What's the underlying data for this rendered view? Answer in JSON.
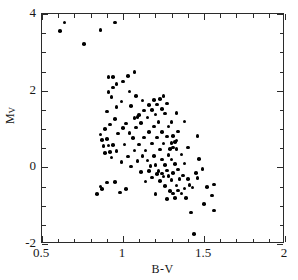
{
  "chart_data": {
    "type": "scatter",
    "title": "",
    "xlabel": "B-V",
    "ylabel": "M_V",
    "ylabel_base": "M",
    "ylabel_sub": "V",
    "xlim": [
      0.5,
      2.0
    ],
    "ylim": [
      4.0,
      -2.0
    ],
    "y_inverted": true,
    "grid": false,
    "legend": null,
    "xticks_major": [
      0.5,
      1.0,
      1.5,
      2.0
    ],
    "xticklabels": [
      "0.5",
      "1",
      "1.5",
      "2"
    ],
    "xticks_minor": [
      0.6,
      0.7,
      0.8,
      0.9,
      1.1,
      1.2,
      1.3,
      1.4,
      1.6,
      1.7,
      1.8,
      1.9
    ],
    "yticks_major": [
      -2,
      0,
      2,
      4
    ],
    "yticklabels": [
      "-2",
      "0",
      "2",
      "4"
    ],
    "yticks_minor": [
      -1.5,
      -1.0,
      -0.5,
      0.5,
      1.0,
      1.5,
      2.5,
      3.0,
      3.5
    ],
    "marker": "filled-circle",
    "marker_color": "#000000",
    "marker_size_px": 3.6,
    "n_points": 148,
    "points": [
      [
        1.44,
        -1.74
      ],
      [
        1.42,
        -1.18
      ],
      [
        1.56,
        -1.13
      ],
      [
        1.5,
        -0.95
      ],
      [
        1.27,
        -0.83
      ],
      [
        1.32,
        -0.8
      ],
      [
        1.39,
        -0.8
      ],
      [
        1.55,
        -0.74
      ],
      [
        0.84,
        -0.7
      ],
      [
        1.2,
        -0.7
      ],
      [
        1.31,
        -0.68
      ],
      [
        1.36,
        -0.68
      ],
      [
        0.98,
        -0.66
      ],
      [
        1.29,
        -0.62
      ],
      [
        1.34,
        -0.6
      ],
      [
        0.87,
        -0.57
      ],
      [
        1.02,
        -0.56
      ],
      [
        1.38,
        -0.55
      ],
      [
        1.43,
        -0.53
      ],
      [
        1.52,
        -0.52
      ],
      [
        0.86,
        -0.5
      ],
      [
        1.26,
        -0.49
      ],
      [
        1.33,
        -0.47
      ],
      [
        1.41,
        -0.46
      ],
      [
        1.56,
        -0.45
      ],
      [
        0.9,
        -0.4
      ],
      [
        0.95,
        -0.38
      ],
      [
        1.14,
        -0.37
      ],
      [
        1.23,
        -0.35
      ],
      [
        1.3,
        -0.33
      ],
      [
        1.35,
        -0.31
      ],
      [
        1.4,
        -0.3
      ],
      [
        1.46,
        -0.28
      ],
      [
        1.18,
        -0.26
      ],
      [
        1.25,
        -0.24
      ],
      [
        1.28,
        -0.22
      ],
      [
        1.37,
        -0.21
      ],
      [
        1.21,
        -0.18
      ],
      [
        1.24,
        -0.16
      ],
      [
        1.31,
        -0.15
      ],
      [
        1.45,
        -0.15
      ],
      [
        1.11,
        -0.12
      ],
      [
        1.16,
        -0.1
      ],
      [
        1.22,
        -0.09
      ],
      [
        1.27,
        -0.08
      ],
      [
        1.34,
        -0.06
      ],
      [
        1.49,
        -0.04
      ],
      [
        1.05,
        0.02
      ],
      [
        1.17,
        0.04
      ],
      [
        1.2,
        0.06
      ],
      [
        1.26,
        0.06
      ],
      [
        1.32,
        0.08
      ],
      [
        1.38,
        0.1
      ],
      [
        0.99,
        0.14
      ],
      [
        1.09,
        0.16
      ],
      [
        1.15,
        0.18
      ],
      [
        1.24,
        0.2
      ],
      [
        1.3,
        0.2
      ],
      [
        1.47,
        0.22
      ],
      [
        0.93,
        0.26
      ],
      [
        1.03,
        0.28
      ],
      [
        1.12,
        0.3
      ],
      [
        1.19,
        0.3
      ],
      [
        1.28,
        0.32
      ],
      [
        1.36,
        0.34
      ],
      [
        0.89,
        0.38
      ],
      [
        0.92,
        0.4
      ],
      [
        0.96,
        0.42
      ],
      [
        1.07,
        0.44
      ],
      [
        1.14,
        0.44
      ],
      [
        1.23,
        0.46
      ],
      [
        1.29,
        0.48
      ],
      [
        1.33,
        0.48
      ],
      [
        1.31,
        0.52
      ],
      [
        1.4,
        0.52
      ],
      [
        0.88,
        0.56
      ],
      [
        0.91,
        0.57
      ],
      [
        0.94,
        0.58
      ],
      [
        1.01,
        0.6
      ],
      [
        1.1,
        0.6
      ],
      [
        1.18,
        0.62
      ],
      [
        1.25,
        0.62
      ],
      [
        1.3,
        0.64
      ],
      [
        1.32,
        0.66
      ],
      [
        1.33,
        0.7
      ],
      [
        0.87,
        0.72
      ],
      [
        0.9,
        0.74
      ],
      [
        1.06,
        0.76
      ],
      [
        1.13,
        0.78
      ],
      [
        1.21,
        0.78
      ],
      [
        1.27,
        0.8
      ],
      [
        1.31,
        0.82
      ],
      [
        1.46,
        0.82
      ],
      [
        0.86,
        0.86
      ],
      [
        0.97,
        0.88
      ],
      [
        1.04,
        0.9
      ],
      [
        1.16,
        0.92
      ],
      [
        1.24,
        0.92
      ],
      [
        1.34,
        0.94
      ],
      [
        0.89,
        1.0
      ],
      [
        1.0,
        1.02
      ],
      [
        1.08,
        1.04
      ],
      [
        1.19,
        1.06
      ],
      [
        1.28,
        1.06
      ],
      [
        0.92,
        1.12
      ],
      [
        1.02,
        1.14
      ],
      [
        1.11,
        1.16
      ],
      [
        1.22,
        1.18
      ],
      [
        1.3,
        1.18
      ],
      [
        1.38,
        1.2
      ],
      [
        0.95,
        1.26
      ],
      [
        1.07,
        1.28
      ],
      [
        1.15,
        1.3
      ],
      [
        1.09,
        1.32
      ],
      [
        1.1,
        1.36
      ],
      [
        1.2,
        1.38
      ],
      [
        1.26,
        1.4
      ],
      [
        1.33,
        1.42
      ],
      [
        0.9,
        1.46
      ],
      [
        1.13,
        1.48
      ],
      [
        1.18,
        1.5
      ],
      [
        1.24,
        1.52
      ],
      [
        0.96,
        1.58
      ],
      [
        1.05,
        1.6
      ],
      [
        1.16,
        1.62
      ],
      [
        1.21,
        1.64
      ],
      [
        1.27,
        1.66
      ],
      [
        0.99,
        1.72
      ],
      [
        1.12,
        1.74
      ],
      [
        1.19,
        1.76
      ],
      [
        1.23,
        1.78
      ],
      [
        0.93,
        1.84
      ],
      [
        1.08,
        1.86
      ],
      [
        1.25,
        1.86
      ],
      [
        0.91,
        1.96
      ],
      [
        1.04,
        1.98
      ],
      [
        0.94,
        2.08
      ],
      [
        0.96,
        2.18
      ],
      [
        1.0,
        2.24
      ],
      [
        0.91,
        2.36
      ],
      [
        0.94,
        2.36
      ],
      [
        1.03,
        2.38
      ],
      [
        1.07,
        2.48
      ],
      [
        0.76,
        3.22
      ],
      [
        0.61,
        3.56
      ],
      [
        0.86,
        3.58
      ],
      [
        0.64,
        3.78
      ],
      [
        0.95,
        3.78
      ]
    ]
  }
}
